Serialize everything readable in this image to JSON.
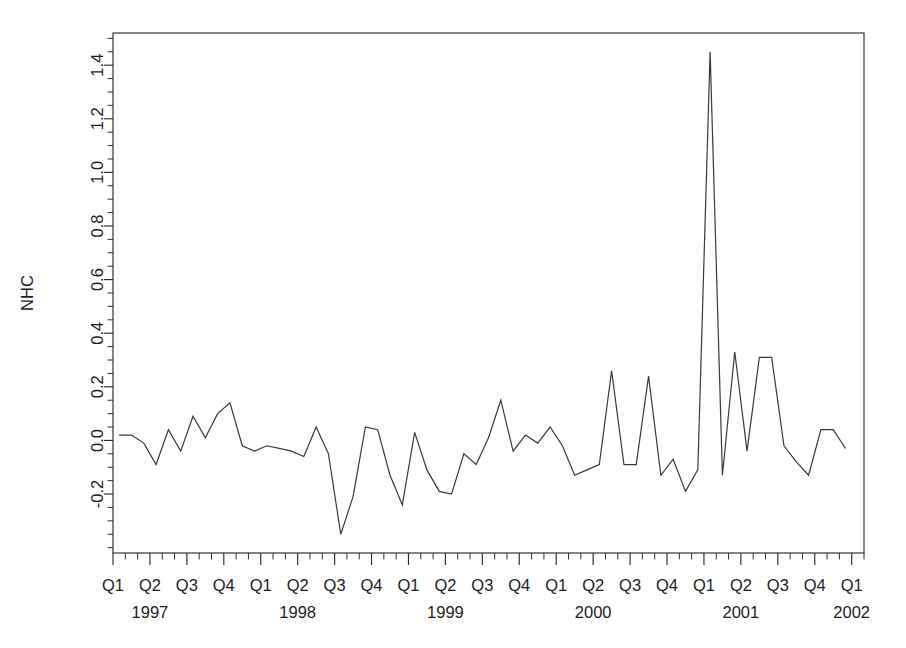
{
  "chart_data": {
    "type": "line",
    "title": "",
    "subtitle": "",
    "xlabel": "",
    "ylabel": "NHC",
    "ylim": [
      -0.42,
      1.52
    ],
    "xlim": [
      0,
      61
    ],
    "grid": false,
    "legend": null,
    "y_ticks_major": [
      -0.2,
      0.0,
      0.2,
      0.4,
      0.6,
      0.8,
      1.0,
      1.2,
      1.4
    ],
    "y_tick_labels": [
      "-0.2",
      "0.0",
      "0.2",
      "0.4",
      "0.6",
      "0.8",
      "1.0",
      "1.2",
      "1.4"
    ],
    "y_minor_tick_step": 0.05,
    "x_quarter_labels": [
      "Q1",
      "Q2",
      "Q3",
      "Q4",
      "Q1",
      "Q2",
      "Q3",
      "Q4",
      "Q1",
      "Q2",
      "Q3",
      "Q4",
      "Q1",
      "Q2",
      "Q3",
      "Q4",
      "Q1",
      "Q2",
      "Q3",
      "Q4",
      "Q1"
    ],
    "x_year_labels": [
      "1997",
      "1998",
      "1999",
      "2000",
      "2001",
      "2002"
    ],
    "x_minor_ticks_per_quarter": 3,
    "series_name": "NHC",
    "x": [
      "1997-01",
      "1997-02",
      "1997-03",
      "1997-04",
      "1997-05",
      "1997-06",
      "1997-07",
      "1997-08",
      "1997-09",
      "1997-10",
      "1997-11",
      "1997-12",
      "1998-01",
      "1998-02",
      "1998-03",
      "1998-04",
      "1998-05",
      "1998-06",
      "1998-07",
      "1998-08",
      "1998-09",
      "1998-10",
      "1998-11",
      "1998-12",
      "1999-01",
      "1999-02",
      "1999-03",
      "1999-04",
      "1999-05",
      "1999-06",
      "1999-07",
      "1999-08",
      "1999-09",
      "1999-10",
      "1999-11",
      "1999-12",
      "2000-01",
      "2000-02",
      "2000-03",
      "2000-04",
      "2000-05",
      "2000-06",
      "2000-07",
      "2000-08",
      "2000-09",
      "2000-10",
      "2000-11",
      "2000-12",
      "2001-01",
      "2001-02",
      "2001-03",
      "2001-04",
      "2001-05",
      "2001-06",
      "2001-07",
      "2001-08",
      "2001-09",
      "2001-10",
      "2001-11",
      "2001-12"
    ],
    "values": [
      0.02,
      0.02,
      -0.01,
      -0.09,
      0.04,
      -0.04,
      0.09,
      0.01,
      0.1,
      0.14,
      -0.02,
      -0.04,
      -0.02,
      -0.03,
      -0.04,
      -0.06,
      0.05,
      -0.05,
      -0.35,
      -0.21,
      0.05,
      0.04,
      -0.13,
      -0.24,
      0.03,
      -0.11,
      -0.19,
      -0.2,
      -0.05,
      -0.09,
      0.01,
      0.15,
      -0.04,
      0.02,
      -0.01,
      0.05,
      -0.02,
      -0.13,
      -0.11,
      -0.09,
      0.26,
      -0.09,
      -0.09,
      0.24,
      -0.13,
      -0.07,
      -0.19,
      -0.11,
      1.45,
      -0.13,
      0.33,
      -0.04,
      0.31,
      0.31,
      -0.02,
      -0.08,
      -0.13,
      0.04,
      0.04,
      -0.03
    ]
  },
  "axis": {
    "ylabel": "NHC"
  }
}
